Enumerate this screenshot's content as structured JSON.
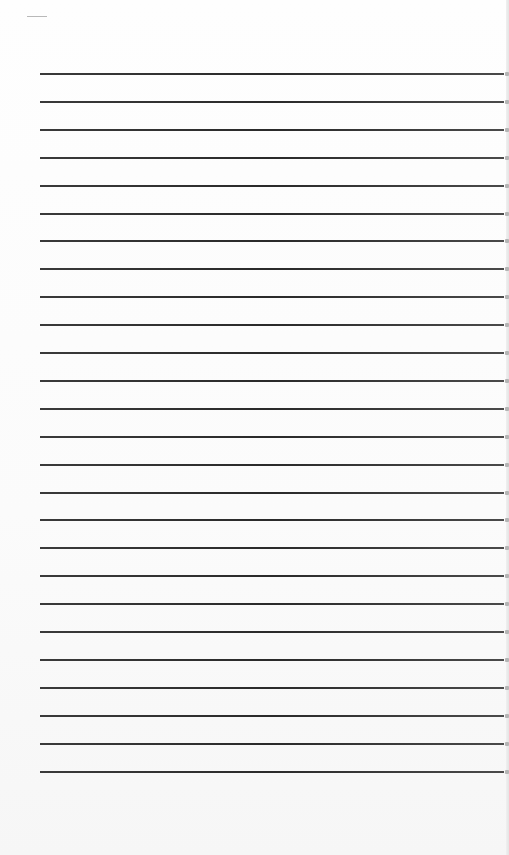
{
  "document": {
    "type": "lined-paper",
    "text": "",
    "rules": {
      "count": 26,
      "left_px": 40,
      "right_px": 504,
      "first_y_px": 73,
      "spacing_px": 27.9,
      "color": "#2e2e2e"
    },
    "background_color": "#fdfdfd",
    "corner_mark": {
      "x": 27,
      "y": 16,
      "width": 20
    }
  }
}
